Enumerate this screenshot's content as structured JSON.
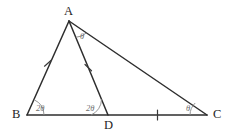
{
  "figure": {
    "kind": "geometry-diagram",
    "width": 233,
    "height": 133,
    "background_color": "#ffffff",
    "line_color": "#2e2e2e",
    "arc_color": "#8a8a8a",
    "label_color": "#1e1e1e",
    "angle_label_color": "#6f6f6f"
  },
  "vertices": [
    {
      "name": "A",
      "label": "A",
      "x": 69,
      "y": 21,
      "label_x": 64,
      "label_y": 5
    },
    {
      "name": "B",
      "label": "B",
      "x": 27,
      "y": 115,
      "label_x": 12,
      "label_y": 108
    },
    {
      "name": "C",
      "label": "C",
      "x": 207,
      "y": 115,
      "label_x": 213,
      "label_y": 108
    },
    {
      "name": "D",
      "label": "D",
      "x": 108,
      "y": 115,
      "label_x": 104,
      "label_y": 119
    }
  ],
  "segments": [
    {
      "name": "AB",
      "from": "A",
      "to": "B"
    },
    {
      "name": "BC",
      "from": "B",
      "to": "C"
    },
    {
      "name": "AC",
      "from": "A",
      "to": "C"
    },
    {
      "name": "AD",
      "from": "A",
      "to": "D"
    }
  ],
  "angles": [
    {
      "name": "angle-B",
      "at": "B",
      "label": "2θ",
      "label_x": 36,
      "label_y": 104
    },
    {
      "name": "angle-ADB",
      "at": "D",
      "label": "2θ",
      "label_x": 86,
      "label_y": 104
    },
    {
      "name": "angle-DAC",
      "at": "A",
      "label": "θ",
      "label_x": 80,
      "label_y": 32
    },
    {
      "name": "angle-C",
      "at": "C",
      "label": "θ",
      "label_x": 186,
      "label_y": 104
    }
  ],
  "tick_marks": [
    {
      "name": "tick-AB",
      "on": "AB",
      "count": 1
    },
    {
      "name": "tick-AD",
      "on": "AD",
      "count": 1
    },
    {
      "name": "tick-DC",
      "on": "DC",
      "count": 1
    }
  ]
}
